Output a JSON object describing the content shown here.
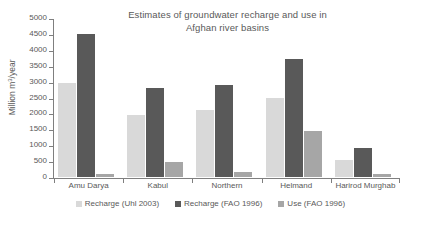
{
  "chart_data": {
    "type": "bar",
    "title": "Estimates of groundwater recharge and use in Afghan river basins",
    "title_line1": "Estimates of groundwater recharge and use in",
    "title_line2": "Afghan river basins",
    "xlabel": "",
    "ylabel": "Million m3/year",
    "ylabel_prefix": "Million m",
    "ylabel_sup": "3",
    "ylabel_suffix": "/year",
    "ylim": [
      0,
      5000
    ],
    "ytick_step": 500,
    "yticks": [
      0,
      500,
      1000,
      1500,
      2000,
      2500,
      3000,
      3500,
      4000,
      4500,
      5000
    ],
    "grid": false,
    "legend_position": "bottom",
    "categories": [
      "Amu Darya",
      "Kabul",
      "Northern",
      "Helmand",
      "Harirod Murghab"
    ],
    "series": [
      {
        "name": "Recharge (Uhl 2003)",
        "color": "#d9d9d9",
        "values": [
          2950,
          1950,
          2100,
          2500,
          550
        ]
      },
      {
        "name": "Recharge (FAO 1996)",
        "color": "#595959",
        "values": [
          4500,
          2800,
          2900,
          3700,
          900
        ]
      },
      {
        "name": "Use (FAO 1996)",
        "color": "#a6a6a6",
        "values": [
          100,
          480,
          150,
          1450,
          100
        ]
      }
    ]
  }
}
